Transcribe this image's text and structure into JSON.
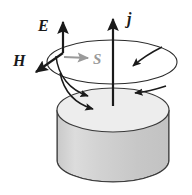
{
  "figure": {
    "background_color": "#ffffff",
    "labels": {
      "e_field": "E",
      "h_field": "H",
      "poynting": "S",
      "current_density": "j"
    },
    "colors": {
      "stroke_dark": "#1a1a1a",
      "stroke_gray": "#9a9a9a",
      "cylinder_top_fill": "#ededed",
      "cylinder_body_fill": "#cdcdcd",
      "cylinder_body_highlight": "#dedede",
      "outline": "#3a3a3a"
    },
    "geometry": {
      "field_loop": {
        "cx": 112,
        "cy": 62,
        "rx": 65,
        "ry": 22
      },
      "cylinder_top": {
        "cx": 113,
        "cy": 110,
        "rx": 56,
        "ry": 22
      },
      "cylinder_bottom_y": 160,
      "cylinder_height": 50
    },
    "vectors": [
      {
        "name": "E",
        "label": "E",
        "direction": "up",
        "color": "#1a1a1a"
      },
      {
        "name": "H",
        "label": "H",
        "direction": "down-left",
        "color": "#1a1a1a"
      },
      {
        "name": "S",
        "label": "S",
        "direction": "right",
        "color": "#9a9a9a"
      },
      {
        "name": "j",
        "label": "j",
        "direction": "up",
        "color": "#1a1a1a"
      }
    ],
    "inflow_arrows_count": 4
  }
}
